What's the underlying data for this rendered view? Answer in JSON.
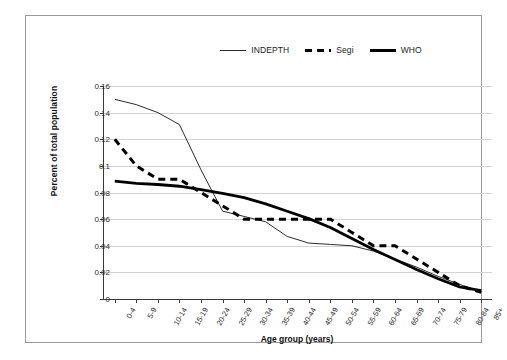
{
  "chart_data": {
    "type": "line",
    "title": "",
    "xlabel": "Age group (years)",
    "ylabel": "Percent of total population",
    "ylim": [
      0,
      0.16
    ],
    "ytick_step": 0.02,
    "yticks": [
      "0",
      "0.02",
      "0.04",
      "0.06",
      "0.08",
      "0.1",
      "0.12",
      "0.14",
      "0.16"
    ],
    "grid": true,
    "legend_position": "top-center",
    "categories": [
      "0-4",
      "5-9",
      "10-14",
      "15-19",
      "20-24",
      "25-29",
      "30-34",
      "35-39",
      "40-44",
      "45-49",
      "50-54",
      "55-59",
      "60-64",
      "65-69",
      "70-74",
      "75-79",
      "80-84",
      "85+"
    ],
    "series": [
      {
        "name": "INDEPTH",
        "style": "thin-solid",
        "color": "#2b2b2b",
        "values": [
          0.15,
          0.146,
          0.14,
          0.131,
          0.097,
          0.066,
          0.062,
          0.058,
          0.047,
          0.042,
          0.041,
          0.04,
          0.036,
          0.03,
          0.024,
          0.017,
          0.011,
          0.005
        ]
      },
      {
        "name": "Segi",
        "style": "dashed",
        "color": "#000000",
        "values": [
          0.12,
          0.1,
          0.09,
          0.09,
          0.08,
          0.07,
          0.06,
          0.06,
          0.06,
          0.06,
          0.06,
          0.05,
          0.04,
          0.04,
          0.03,
          0.02,
          0.01,
          0.005
        ]
      },
      {
        "name": "WHO",
        "style": "thick-solid",
        "color": "#000000",
        "values": [
          0.0886,
          0.0869,
          0.086,
          0.0847,
          0.0822,
          0.0793,
          0.0761,
          0.0715,
          0.0659,
          0.0604,
          0.0537,
          0.0455,
          0.0372,
          0.0296,
          0.0221,
          0.0152,
          0.0091,
          0.0063
        ]
      }
    ]
  },
  "legend": {
    "items": [
      {
        "label": "INDEPTH",
        "swatch": "thin-line-swatch"
      },
      {
        "label": "Segi",
        "swatch": "dashed-line-swatch"
      },
      {
        "label": "WHO",
        "swatch": "thick-line-swatch"
      }
    ]
  },
  "colors": {
    "frame": "#9a9a9a",
    "axis": "#3a3a3a",
    "grid": "#d2d2d2",
    "text": "#2c2c2c",
    "background": "#ffffff"
  }
}
